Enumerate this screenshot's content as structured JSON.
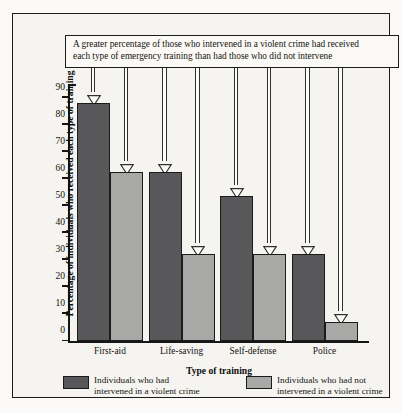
{
  "callout": {
    "line1": "A greater percentage of those who intervened in a violent crime had received",
    "line2": "each type of emergency training than had those who did not intervene"
  },
  "chart_data": {
    "type": "bar",
    "title": "",
    "xlabel": "Type of training",
    "ylabel": "Percentage of individuals who received each type of training",
    "categories": [
      "First-aid",
      "Life-saving",
      "Self-defense",
      "Police"
    ],
    "series": [
      {
        "name": "Individuals who had intervened in a violent crime",
        "color": "#58585a",
        "values": [
          88,
          62.5,
          53.5,
          32
        ]
      },
      {
        "name": "Individuals who had not intervened in a violent crime",
        "color": "#a8a8a6",
        "values": [
          62.5,
          32,
          32,
          7
        ]
      }
    ],
    "ylim": [
      0,
      95
    ],
    "yticks": [
      0,
      10,
      20,
      30,
      40,
      50,
      60,
      70,
      80,
      90
    ],
    "ytick_labels": [
      "0",
      "10",
      "20",
      "30",
      "40",
      "50",
      "60",
      "70",
      "80",
      "90"
    ],
    "grid": false,
    "legend_position": "bottom"
  },
  "legend": {
    "items": [
      {
        "line1": "Individuals who had",
        "line2": "intervened in a violent crime",
        "color": "#58585a"
      },
      {
        "line1": "Individuals who had not",
        "line2": "intervened in a violent crime",
        "color": "#a8a8a6"
      }
    ]
  },
  "colors": {
    "dark_series": "#58585a",
    "light_series": "#a8a8a6",
    "paper": "#f6f4f0",
    "ink": "#161616"
  }
}
